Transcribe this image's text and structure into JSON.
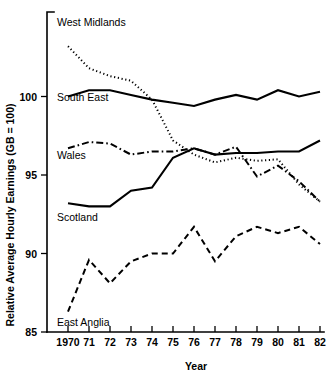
{
  "chart_data": {
    "type": "line",
    "title": "",
    "subtitle": "",
    "xlabel": "Year",
    "ylabel": "Relative Average Hourly Earnings (GB = 100)",
    "xlim": [
      1970,
      1982
    ],
    "ylim": [
      85,
      103.6
    ],
    "grid": false,
    "legend_position": "inline-labels",
    "x": [
      1970,
      1971,
      1972,
      1973,
      1974,
      1975,
      1976,
      1977,
      1978,
      1979,
      1980,
      1981,
      1982
    ],
    "xtick_labels": [
      "1970",
      "71",
      "72",
      "73",
      "74",
      "75",
      "76",
      "77",
      "78",
      "79",
      "80",
      "81",
      "82"
    ],
    "ytick_labels": [
      "85",
      "90",
      "95",
      "100"
    ],
    "yticks": [
      85,
      90,
      95,
      100
    ],
    "series": [
      {
        "name": "West Midlands",
        "style": "dotted",
        "label": "West Midlands",
        "values": [
          103.2,
          101.8,
          101.3,
          101.0,
          99.8,
          97.2,
          96.3,
          95.8,
          96.1,
          95.9,
          96.0,
          94.4,
          93.3
        ]
      },
      {
        "name": "South East",
        "style": "solid",
        "label": "South East",
        "values": [
          100.0,
          100.4,
          100.4,
          100.1,
          99.8,
          99.6,
          99.4,
          99.8,
          100.1,
          99.8,
          100.4,
          100.0,
          100.3
        ]
      },
      {
        "name": "Wales",
        "style": "dash-dot",
        "label": "Wales",
        "values": [
          96.7,
          97.1,
          97.0,
          96.3,
          96.5,
          96.5,
          96.7,
          96.3,
          96.8,
          94.9,
          95.6,
          94.6,
          93.3
        ]
      },
      {
        "name": "Scotland",
        "style": "solid",
        "label": "Scotland",
        "values": [
          93.2,
          93.0,
          93.0,
          94.0,
          94.2,
          96.1,
          96.7,
          96.3,
          96.4,
          96.4,
          96.5,
          96.5,
          97.2
        ]
      },
      {
        "name": "East Anglia",
        "style": "dashed",
        "label": "East Anglia",
        "values": [
          86.3,
          89.6,
          88.1,
          89.5,
          90.0,
          90.0,
          91.7,
          89.5,
          91.1,
          91.7,
          91.3,
          91.7,
          90.6
        ]
      }
    ]
  },
  "labels": {
    "y_axis_title": "Relative Average Hourly Earnings (GB = 100)",
    "x_axis_title": "Year"
  }
}
